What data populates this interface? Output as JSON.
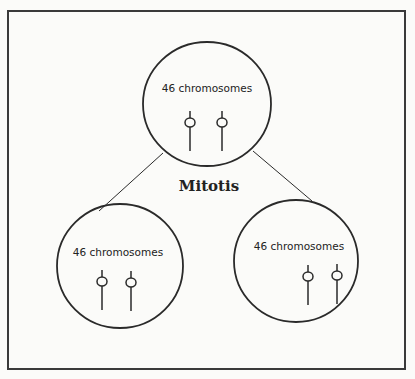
{
  "diagram": {
    "process_label": "Mitotis",
    "parent_cell": {
      "label": "46 chromosomes",
      "chromosome_count_drawn": 2
    },
    "daughter_cells": [
      {
        "label": "46 chromosomes",
        "chromosome_count_drawn": 2
      },
      {
        "label": "46 chromosomes",
        "chromosome_count_drawn": 2
      }
    ],
    "colors": {
      "stroke": "#2a2a2a",
      "background": "#fbfbf9"
    }
  }
}
